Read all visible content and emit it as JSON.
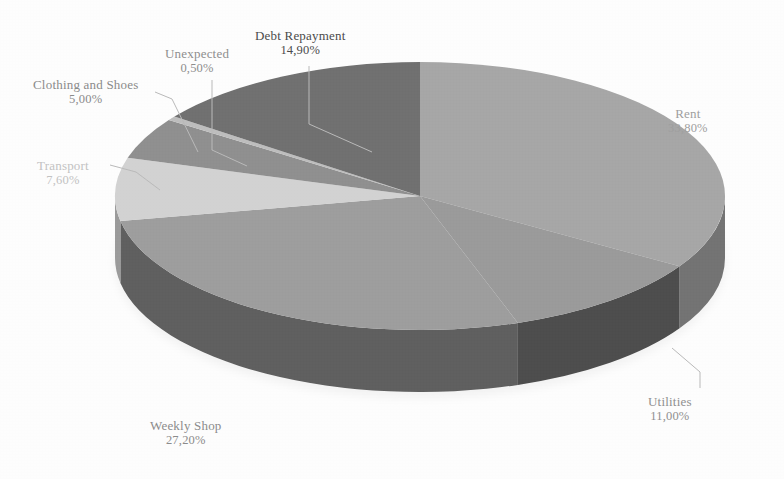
{
  "chart_data": {
    "type": "pie",
    "title": "",
    "subtitle": "",
    "xlabel": "",
    "ylabel": "",
    "legend_position": "none",
    "grid": false,
    "three_d": true,
    "value_format": "percent_comma_two_decimals",
    "categories": [
      "Rent",
      "Utilities",
      "Weekly Shop",
      "Transport",
      "Clothing and Shoes",
      "Unexpected",
      "Debt Repayment"
    ],
    "values": [
      33.8,
      11.0,
      27.2,
      7.6,
      5.0,
      0.5,
      14.9
    ],
    "slices": [
      {
        "label": "Rent",
        "value": 33.8,
        "value_text": "33,80%",
        "color": "#a6a6a6",
        "side_color": "#737373",
        "start_deg": 0.0,
        "end_deg": 121.68,
        "label_color": "#9e9e9e"
      },
      {
        "label": "Utilities",
        "value": 11.0,
        "value_text": "11,00%",
        "color": "#9a9a9a",
        "side_color": "#4d4d4d",
        "start_deg": 121.68,
        "end_deg": 161.28,
        "label_color": "#8f8f8f"
      },
      {
        "label": "Weekly Shop",
        "value": 27.2,
        "value_text": "27,20%",
        "color": "#9d9d9d",
        "side_color": "#5e5e5e",
        "start_deg": 161.28,
        "end_deg": 259.2,
        "label_color": "#8b8b8b"
      },
      {
        "label": "Transport",
        "value": 7.6,
        "value_text": "7,60%",
        "color": "#d2d2d2",
        "side_color": "#9a9a9a",
        "start_deg": 259.2,
        "end_deg": 286.56,
        "label_color": "#c2c2c2"
      },
      {
        "label": "Clothing and Shoes",
        "value": 5.0,
        "value_text": "5,00%",
        "color": "#8f8f8f",
        "side_color": "#6b6b6b",
        "start_deg": 286.56,
        "end_deg": 304.56,
        "label_color": "#8a8a8a"
      },
      {
        "label": "Unexpected",
        "value": 0.5,
        "value_text": "0,50%",
        "color": "#bdbdbd",
        "side_color": "#8c8c8c",
        "start_deg": 304.56,
        "end_deg": 306.36,
        "label_color": "#8d8d8d"
      },
      {
        "label": "Debt Repayment",
        "value": 14.9,
        "value_text": "14,90%",
        "color": "#6f6f6f",
        "side_color": "#565656",
        "start_deg": 306.36,
        "end_deg": 360.0,
        "label_color": "#4a4a4a"
      }
    ],
    "labels": {
      "debt_repayment": {
        "name": "Debt Repayment",
        "value": "14,90%"
      },
      "unexpected": {
        "name": "Unexpected",
        "value": "0,50%"
      },
      "clothing_and_shoes": {
        "name": "Clothing and Shoes",
        "value": "5,00%"
      },
      "transport": {
        "name": "Transport",
        "value": "7,60%"
      },
      "rent": {
        "name": "Rent",
        "value": "33,80%"
      },
      "utilities": {
        "name": "Utilities",
        "value": "11,00%"
      },
      "weekly_shop": {
        "name": "Weekly Shop",
        "value": "27,20%"
      }
    },
    "geometry": {
      "center_x": 420,
      "center_y": 196,
      "radius_x": 305,
      "radius_y": 134,
      "depth": 62
    },
    "colors": {
      "background": "#fdfdfd",
      "leader_line": "#b9b9b9",
      "darkest_slice": "#6f6f6f",
      "lightest_slice": "#d2d2d2"
    }
  }
}
